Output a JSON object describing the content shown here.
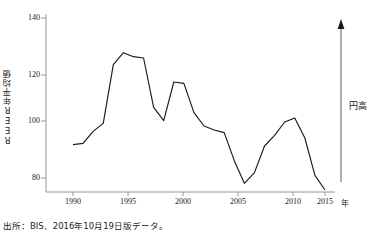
{
  "chart_data": {
    "type": "line",
    "title": "",
    "subtitle": "",
    "xlabel": "年",
    "ylabel": "REER年平均値",
    "xlim": [
      1989,
      2016
    ],
    "ylim": [
      72,
      142
    ],
    "grid": false,
    "legend": null,
    "x_ticks": [
      "1990",
      "1995",
      "2000",
      "2005",
      "2010",
      "2015"
    ],
    "x_tick_values": [
      1990,
      1995,
      2000,
      2005,
      2010,
      2015
    ],
    "y_ticks": [
      "80",
      "100",
      "120",
      "140"
    ],
    "y_tick_values": [
      80,
      100,
      120,
      140
    ],
    "series": [
      {
        "name": "REER年平均値",
        "color": "#1a1a1a",
        "x": [
          1990,
          1991,
          1992,
          1993,
          1994,
          1995,
          1996,
          1997,
          1998,
          1999,
          2000,
          2001,
          2002,
          2003,
          2004,
          2005,
          2006,
          2007,
          2008,
          2009,
          2010,
          2011,
          2012,
          2013,
          2014,
          2015
        ],
        "values": [
          92.5,
          93.0,
          97.5,
          100.5,
          122.5,
          127.0,
          125.5,
          125.0,
          106.5,
          101.5,
          116.0,
          115.5,
          104.5,
          99.5,
          98.0,
          97.0,
          86.5,
          78.0,
          82.0,
          92.0,
          96.0,
          101.0,
          102.5,
          95.0,
          81.0,
          75.5
        ]
      }
    ],
    "annotations": [
      {
        "name": "yen-appreciation-arrow",
        "label": "円高",
        "direction": "up",
        "description": "vertical arrow pointing up at right edge of plot"
      }
    ]
  },
  "source": {
    "note": "出所：BIS、2016年10月19日版データ。"
  },
  "axes": {
    "y_axis_label": "REER年平均値",
    "x_axis_unit": "年"
  }
}
